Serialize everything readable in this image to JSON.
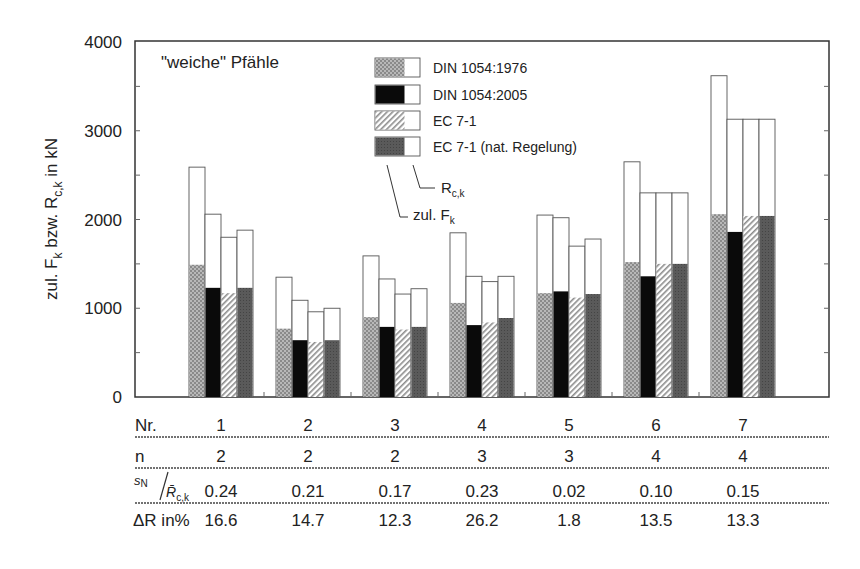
{
  "chart_data": {
    "type": "bar",
    "title": "\"weiche\" Pfähle",
    "xlabel": "Nr.",
    "ylabel": "zul. F_k bzw. R_c,k in kN",
    "ylim": [
      0,
      4000
    ],
    "yticks": [
      0,
      1000,
      2000,
      3000,
      4000
    ],
    "grid": false,
    "legend_position": "top-center inside",
    "categories": [
      "1",
      "2",
      "3",
      "4",
      "5",
      "6",
      "7"
    ],
    "series": [
      {
        "name": "DIN 1054:1976",
        "fill": "dotted-lightgray",
        "R_ck": [
          2590,
          1350,
          1590,
          1850,
          2050,
          2650,
          3620
        ],
        "zul_Fk": [
          1490,
          770,
          900,
          1060,
          1170,
          1520,
          2060
        ]
      },
      {
        "name": "DIN 1054:2005",
        "fill": "black",
        "R_ck": [
          2060,
          1090,
          1330,
          1360,
          2020,
          2300,
          3130
        ],
        "zul_Fk": [
          1230,
          640,
          790,
          810,
          1190,
          1360,
          1860
        ]
      },
      {
        "name": "EC 7-1",
        "fill": "hatched-white",
        "R_ck": [
          1800,
          960,
          1160,
          1300,
          1700,
          2300,
          3130
        ],
        "zul_Fk": [
          1170,
          620,
          760,
          840,
          1120,
          1500,
          2040
        ]
      },
      {
        "name": "EC 7-1 (nat. Regelung)",
        "fill": "darkgray",
        "R_ck": [
          1880,
          1000,
          1220,
          1360,
          1780,
          2300,
          3130
        ],
        "zul_Fk": [
          1230,
          640,
          790,
          890,
          1160,
          1500,
          2040
        ]
      }
    ],
    "annotations": [
      "R_c,k",
      "zul. F_k"
    ],
    "table": {
      "rows": [
        {
          "label": "Nr.",
          "values": [
            "1",
            "2",
            "3",
            "4",
            "5",
            "6",
            "7"
          ]
        },
        {
          "label": "n",
          "values": [
            "2",
            "2",
            "2",
            "3",
            "3",
            "4",
            "4"
          ]
        },
        {
          "label": "s_N / R̄_c,k",
          "values": [
            "0.24",
            "0.21",
            "0.17",
            "0.23",
            "0.02",
            "0.10",
            "0.15"
          ]
        },
        {
          "label": "ΔR in%",
          "values": [
            "16.6",
            "14.7",
            "12.3",
            "26.2",
            "1.8",
            "13.5",
            "13.3"
          ]
        }
      ]
    }
  },
  "labels": {
    "title": "\"weiche\" Pfähle",
    "ylabel_main": "zul. F",
    "ylabel_sub1": "k",
    "ylabel_mid": " bzw. R",
    "ylabel_sub2": "c,k",
    "ylabel_end": " in kN",
    "legend": [
      "DIN 1054:1976",
      "DIN 1054:2005",
      "EC 7-1",
      "EC 7-1 (nat. Regelung)"
    ],
    "ann_r_main": "R",
    "ann_r_sub": "c,k",
    "ann_f_main": "zul. F",
    "ann_f_sub": "k",
    "row_nr": "Nr.",
    "row_n": "n",
    "row_s_main": "s",
    "row_s_sub": "N",
    "row_s_den": "R̄",
    "row_s_den_sub": "c,k",
    "row_dr": "ΔR in%",
    "yticks": [
      "0",
      "1000",
      "2000",
      "3000",
      "4000"
    ]
  }
}
